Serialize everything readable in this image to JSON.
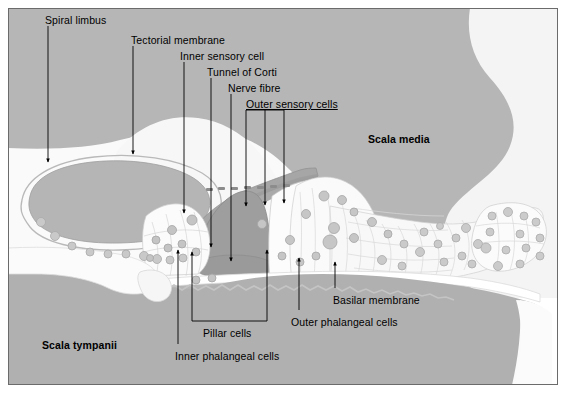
{
  "figure": {
    "canvas": {
      "width": 566,
      "height": 393
    },
    "colors": {
      "background": "#ffffff",
      "border": "#6b6b6b",
      "scala_media_fill": "#b6b6b6",
      "scala_tympani_fill": "#b0b0b0",
      "pale_tissue": "#f2f2f2",
      "white_tissue": "#fbfbfb",
      "spiral_limbus_fill": "#b5b5b5",
      "tectorial_membrane_fill": "#a6a6a6",
      "tunnel_of_corti_fill": "#9e9e9e",
      "cell_nucleus": "#c9c9c9",
      "cell_outline": "#9a9a9a",
      "leader_line": "#000000",
      "label_text": "#000000"
    }
  },
  "labels": [
    {
      "id": "spiral-limbus",
      "text": "Spiral limbus",
      "x": 45,
      "y": 14,
      "bold": false,
      "underline": false
    },
    {
      "id": "tectorial-membrane",
      "text": "Tectorial membrane",
      "x": 131,
      "y": 34,
      "bold": false,
      "underline": false
    },
    {
      "id": "inner-sensory-cell",
      "text": "Inner sensory cell",
      "x": 180,
      "y": 50,
      "bold": false,
      "underline": false
    },
    {
      "id": "tunnel-of-corti",
      "text": "Tunnel of Corti",
      "x": 207,
      "y": 66,
      "bold": false,
      "underline": false
    },
    {
      "id": "nerve-fibre",
      "text": "Nerve fibre",
      "x": 228,
      "y": 82,
      "bold": false,
      "underline": false
    },
    {
      "id": "outer-sensory-cells",
      "text": "Outer sensory cells",
      "x": 246,
      "y": 98,
      "bold": false,
      "underline": true
    },
    {
      "id": "scala-media",
      "text": "Scala media",
      "x": 368,
      "y": 133,
      "bold": true,
      "underline": false
    },
    {
      "id": "basilar-membrane",
      "text": "Basilar membrane",
      "x": 333,
      "y": 294,
      "bold": false,
      "underline": false
    },
    {
      "id": "outer-phalangeal-cells",
      "text": "Outer phalangeal cells",
      "x": 291,
      "y": 316,
      "bold": false,
      "underline": false
    },
    {
      "id": "pillar-cells",
      "text": "Pillar cells",
      "x": 203,
      "y": 327,
      "bold": false,
      "underline": false
    },
    {
      "id": "inner-phalangeal-cells",
      "text": "Inner phalangeal cells",
      "x": 175,
      "y": 350,
      "bold": false,
      "underline": false
    },
    {
      "id": "scala-tympanii",
      "text": "Scala tympanii",
      "x": 42,
      "y": 339,
      "bold": true,
      "underline": false
    }
  ],
  "structures": [
    {
      "id": "spiral-limbus",
      "name": "Spiral limbus"
    },
    {
      "id": "tectorial-membrane",
      "name": "Tectorial membrane"
    },
    {
      "id": "inner-sensory-cell",
      "name": "Inner sensory cell"
    },
    {
      "id": "tunnel-of-corti",
      "name": "Tunnel of Corti"
    },
    {
      "id": "nerve-fibre",
      "name": "Nerve fibre"
    },
    {
      "id": "outer-sensory-cells",
      "name": "Outer sensory cells"
    },
    {
      "id": "scala-media",
      "name": "Scala media"
    },
    {
      "id": "scala-tympani",
      "name": "Scala tympanii"
    },
    {
      "id": "basilar-membrane",
      "name": "Basilar membrane"
    },
    {
      "id": "outer-phalangeal-cells",
      "name": "Outer phalangeal cells"
    },
    {
      "id": "pillar-cells",
      "name": "Pillar cells"
    },
    {
      "id": "inner-phalangeal-cells",
      "name": "Inner phalangeal cells"
    }
  ]
}
